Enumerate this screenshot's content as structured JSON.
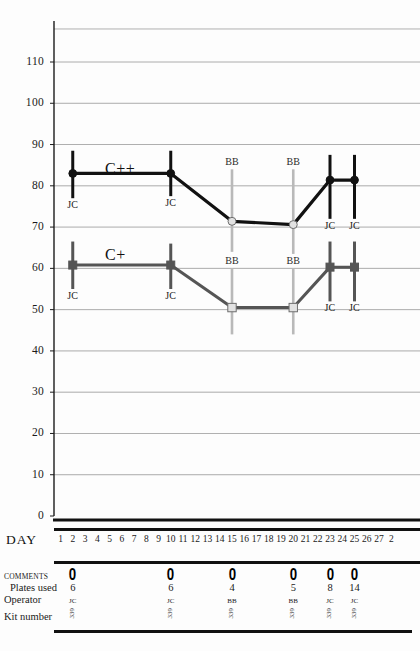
{
  "axis": {
    "y_label_ticks": [
      110,
      100,
      90,
      80,
      70,
      60,
      50,
      40,
      30,
      20,
      10,
      0
    ],
    "x_axis_title": "DAY",
    "x_tick_labels": [
      "1",
      "2",
      "3",
      "4",
      "5",
      "6",
      "7",
      "8",
      "9",
      "10",
      "11",
      "12",
      "13",
      "14",
      "15",
      "16",
      "17",
      "18",
      "19",
      "20",
      "21",
      "22",
      "23",
      "24",
      "25",
      "26",
      "27",
      "2"
    ]
  },
  "series_labels": {
    "upper": "C++",
    "lower": "C+"
  },
  "annotations": {
    "jc": "JC",
    "bb": "BB"
  },
  "table": {
    "comments_label": "COMMENTS",
    "plates_label": "Plates used",
    "operator_label": "Operator",
    "kit_label": "Kit number",
    "comment_marker": "0",
    "entries": [
      {
        "day": 2,
        "plates": "6",
        "operator": "JC",
        "kit": "339"
      },
      {
        "day": 10,
        "plates": "6",
        "operator": "JC",
        "kit": "339"
      },
      {
        "day": 15,
        "plates": "4",
        "operator": "BB",
        "kit": "339"
      },
      {
        "day": 20,
        "plates": "5",
        "operator": "BB",
        "kit": "339"
      },
      {
        "day": 23,
        "plates": "8",
        "operator": "JC",
        "kit": "339"
      },
      {
        "day": 25,
        "plates": "14",
        "operator": "JC",
        "kit": "339"
      }
    ]
  },
  "colors": {
    "upper_series": "#111111",
    "lower_series": "#555555",
    "bb_marker": "#b9b9b9",
    "gridline": "#8d8d8d",
    "axis": "#1a1a1a"
  },
  "chart_data": {
    "type": "line",
    "title": "",
    "xlabel": "DAY",
    "ylabel": "",
    "xlim": [
      0.3,
      28
    ],
    "ylim": [
      0,
      118
    ],
    "grid": true,
    "legend": "inline-labels",
    "series": [
      {
        "name": "C++",
        "color": "#111111",
        "marker": "circle",
        "points": [
          {
            "day": 2,
            "value": 83.0,
            "err_low": 77.0,
            "err_high": 88.5,
            "operator": "JC",
            "marker_fill": "solid"
          },
          {
            "day": 10,
            "value": 83.0,
            "err_low": 77.5,
            "err_high": 88.5,
            "operator": "JC",
            "marker_fill": "solid"
          },
          {
            "day": 15,
            "value": 71.4,
            "err_low": 64.0,
            "err_high": 84.0,
            "operator": "BB",
            "marker_fill": "open"
          },
          {
            "day": 20,
            "value": 70.6,
            "err_low": 63.5,
            "err_high": 84.0,
            "operator": "BB",
            "marker_fill": "open"
          },
          {
            "day": 23,
            "value": 81.4,
            "err_low": 72.0,
            "err_high": 87.5,
            "operator": "JC",
            "marker_fill": "solid"
          },
          {
            "day": 25,
            "value": 81.4,
            "err_low": 72.0,
            "err_high": 87.5,
            "operator": "JC",
            "marker_fill": "solid"
          }
        ]
      },
      {
        "name": "C+",
        "color": "#555555",
        "marker": "square",
        "points": [
          {
            "day": 2,
            "value": 60.8,
            "err_low": 55.0,
            "err_high": 66.5,
            "operator": "JC",
            "marker_fill": "solid"
          },
          {
            "day": 10,
            "value": 60.8,
            "err_low": 55.0,
            "err_high": 66.0,
            "operator": "JC",
            "marker_fill": "solid"
          },
          {
            "day": 15,
            "value": 50.5,
            "err_low": 44.0,
            "err_high": 60.0,
            "operator": "BB",
            "marker_fill": "open"
          },
          {
            "day": 20,
            "value": 50.5,
            "err_low": 44.0,
            "err_high": 60.0,
            "operator": "BB",
            "marker_fill": "open"
          },
          {
            "day": 23,
            "value": 60.3,
            "err_low": 52.0,
            "err_high": 66.5,
            "operator": "JC",
            "marker_fill": "solid"
          },
          {
            "day": 25,
            "value": 60.3,
            "err_low": 52.0,
            "err_high": 66.5,
            "operator": "JC",
            "marker_fill": "solid"
          }
        ]
      }
    ]
  }
}
